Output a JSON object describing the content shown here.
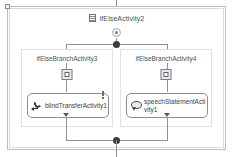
{
  "diagram": {
    "type": "workflow-ifelse",
    "root": {
      "title": "ifElseActivity2",
      "icon": "ifelse-activity-icon",
      "marker_icon": "branch-marker-icon"
    },
    "branches": [
      {
        "title": "ifElseBranchActivity3",
        "condition_icon": "condition-icon",
        "activity": {
          "label": "blindTransferActivity1",
          "icon": "phone-transfer-icon",
          "has_warning": true,
          "warning_icon": "warning-icon"
        }
      },
      {
        "title": "ifElseBranchActivity4",
        "condition_icon": "condition-icon",
        "activity": {
          "label": "speechStatementActivity1",
          "icon": "speech-bubble-icon",
          "has_warning": false,
          "warning_icon": ""
        }
      }
    ],
    "connectors": {
      "entry_arrow": "arrow-down-icon",
      "split_node": "split-node-dot",
      "merge_node": "merge-node-dot",
      "exit_line": "exit-connector"
    },
    "selection": {
      "selected": true,
      "handle": "selection-handle"
    },
    "colors": {
      "line": "#8e9298",
      "node": "#3a3d41",
      "frame": "#b9bcc2",
      "branch_border": "#dfe1e4",
      "text": "#4c5056",
      "box_border": "#8a8e94",
      "background": "#ffffff"
    }
  }
}
